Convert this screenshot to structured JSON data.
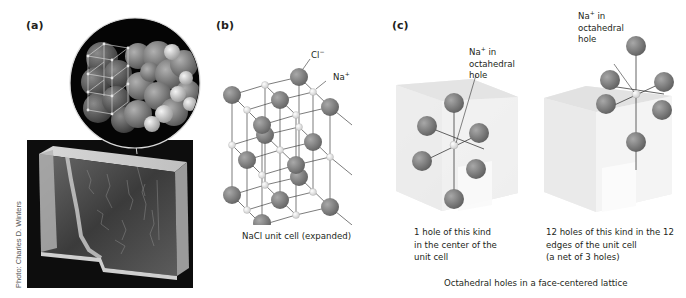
{
  "panels": {
    "a": {
      "label": "(a)",
      "photo_credit": "Photo: Charles D. Winters",
      "description": "Photo of NaCl crystal with magnified inset of packed ion spheres"
    },
    "b": {
      "label": "(b)",
      "caption": "NaCl unit cell (expanded)",
      "cl_label": "Cl",
      "cl_charge": "−",
      "na_label": "Na",
      "na_charge": "+"
    },
    "c": {
      "label": "(c)",
      "left": {
        "ion_label": "Na",
        "ion_charge": "+",
        "ion_label_rest": " in",
        "ion_label_line2": "octahedral",
        "ion_label_line3": "hole",
        "caption_lines": [
          "1 hole of this kind",
          "in the center of the",
          "unit cell"
        ]
      },
      "right": {
        "ion_label": "Na",
        "ion_charge": "+",
        "ion_label_rest": " in",
        "ion_label_line2": "octahedral",
        "ion_label_line3": "hole",
        "caption_lines": [
          "12 holes of this kind in the 12",
          "edges of the unit cell",
          "(a net of 3 holes)"
        ]
      },
      "footer": "Octahedral holes in a face-centered lattice"
    }
  },
  "colors": {
    "large_ion": "#7d7d7d",
    "small_ion": "#f2f2f2",
    "bond": "#444444",
    "cube_face": "#e8e8e8",
    "text": "#231f20"
  }
}
